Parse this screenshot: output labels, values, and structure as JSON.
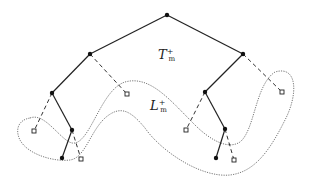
{
  "diagram": {
    "labels": {
      "tree": {
        "base": "T",
        "sup": "+",
        "sub": "m"
      },
      "leaves": {
        "base": "L",
        "sup": "+",
        "sub": "m"
      }
    },
    "colors": {
      "edge": "#222222",
      "dashed": "#333333",
      "region": "#555555",
      "background": "#ffffff"
    },
    "nodes": {
      "filled": [
        [
          167,
          15
        ],
        [
          90,
          54
        ],
        [
          243,
          54
        ],
        [
          52,
          93
        ],
        [
          205,
          92
        ],
        [
          72,
          130
        ],
        [
          225,
          129
        ],
        [
          62,
          158
        ],
        [
          216,
          158
        ]
      ],
      "hollow": [
        [
          127,
          94
        ],
        [
          34,
          131
        ],
        [
          81,
          159
        ],
        [
          282,
          92
        ],
        [
          186,
          130
        ],
        [
          234,
          160
        ]
      ]
    },
    "solid_edges": [
      [
        167,
        15,
        90,
        54
      ],
      [
        167,
        15,
        243,
        54
      ],
      [
        90,
        54,
        52,
        93
      ],
      [
        52,
        93,
        72,
        130
      ],
      [
        72,
        130,
        62,
        158
      ],
      [
        243,
        54,
        205,
        92
      ],
      [
        205,
        92,
        225,
        129
      ],
      [
        225,
        129,
        216,
        158
      ]
    ],
    "dashed_edges": [
      [
        90,
        54,
        127,
        94
      ],
      [
        52,
        93,
        34,
        131
      ],
      [
        72,
        130,
        81,
        159
      ],
      [
        243,
        54,
        282,
        92
      ],
      [
        205,
        92,
        186,
        130
      ],
      [
        225,
        129,
        234,
        160
      ]
    ]
  }
}
